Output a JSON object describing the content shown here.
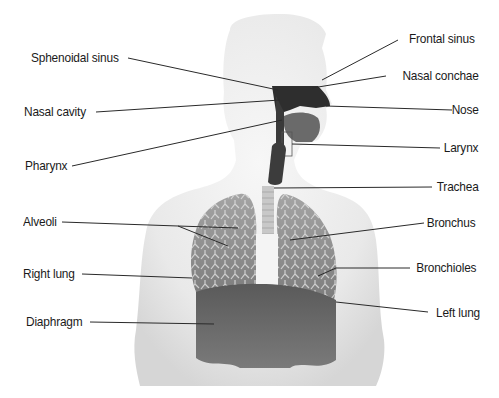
{
  "diagram": {
    "title": "",
    "colors": {
      "background": "#ffffff",
      "body_silhouette": "#ececec",
      "lung_tissue": "#8a8a8a",
      "airway_dark": "#3a3a3a",
      "leader_line": "#2a2a2a",
      "label_text": "#1a1a1a"
    },
    "labels_left": [
      {
        "id": "sphenoidal-sinus",
        "text": "Sphenoidal sinus"
      },
      {
        "id": "nasal-cavity",
        "text": "Nasal cavity"
      },
      {
        "id": "pharynx",
        "text": "Pharynx"
      },
      {
        "id": "alveoli",
        "text": "Alveoli"
      },
      {
        "id": "right-lung",
        "text": "Right lung"
      },
      {
        "id": "diaphragm",
        "text": "Diaphragm"
      }
    ],
    "labels_right": [
      {
        "id": "frontal-sinus",
        "text": "Frontal sinus"
      },
      {
        "id": "nasal-conchae",
        "text": "Nasal conchae"
      },
      {
        "id": "nose",
        "text": "Nose"
      },
      {
        "id": "larynx",
        "text": "Larynx"
      },
      {
        "id": "trachea",
        "text": "Trachea"
      },
      {
        "id": "bronchus",
        "text": "Bronchus"
      },
      {
        "id": "bronchioles",
        "text": "Bronchioles"
      },
      {
        "id": "left-lung",
        "text": "Left lung"
      }
    ]
  }
}
